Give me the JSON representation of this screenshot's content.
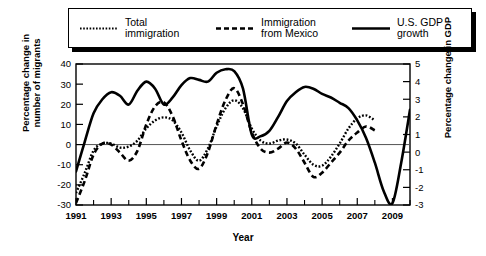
{
  "chart_data": {
    "type": "line",
    "title": "",
    "xlabel": "Year",
    "ylabel": "Percentage change in number of migrants",
    "ylabel_right": "Percentage change in GDP",
    "xlim": [
      1991,
      2010
    ],
    "ylim": [
      -30,
      40
    ],
    "ylim_right": [
      -3,
      5
    ],
    "grid": false,
    "legend_position": "top",
    "x_ticks": [
      1991,
      1993,
      1995,
      1997,
      1999,
      2001,
      2003,
      2005,
      2007,
      2009
    ],
    "x_tick_labels": [
      "1991",
      "1993",
      "1995",
      "1997",
      "1999",
      "2001",
      "2003",
      "2005",
      "2007",
      "2009"
    ],
    "x_minor_ticks": [
      1992,
      1994,
      1996,
      1998,
      2000,
      2002,
      2004,
      2006,
      2008,
      2010
    ],
    "y_ticks": [
      -30,
      -20,
      -10,
      0,
      10,
      20,
      30,
      40
    ],
    "y_tick_labels": [
      "-30",
      "-20",
      "-10",
      "0",
      "10",
      "20",
      "30",
      "40"
    ],
    "y_ticks_right": [
      -3,
      -2,
      -1,
      0,
      1,
      2,
      3,
      4,
      5
    ],
    "y_tick_labels_right": [
      "-3",
      "-2",
      "-1",
      "0",
      "1",
      "2",
      "3",
      "4",
      "5"
    ],
    "series": [
      {
        "name": "Total immigration",
        "style": "dotted",
        "axis": "left",
        "x": [
          1991,
          1991.5,
          1992,
          1992.5,
          1993,
          1993.5,
          1994,
          1994.5,
          1995,
          1995.5,
          1996,
          1996.5,
          1997,
          1997.5,
          1998,
          1998.5,
          1999,
          1999.5,
          2000,
          2000.5,
          2001,
          2001.5,
          2002,
          2002.5,
          2003,
          2003.5,
          2004,
          2004.5,
          2005,
          2005.5,
          2006,
          2006.5,
          2007,
          2007.5,
          2008
        ],
        "values": [
          -24,
          -14,
          -3,
          0.5,
          0.5,
          -1.5,
          -1,
          2,
          8,
          12,
          13.5,
          12,
          6,
          -3,
          -8,
          -2,
          9,
          18,
          22,
          18,
          8,
          2,
          0.5,
          2,
          2.5,
          0.5,
          -5,
          -10,
          -10.5,
          -6,
          0.5,
          8,
          13,
          14.5,
          12
        ]
      },
      {
        "name": "Immigration from Mexico",
        "style": "dashed",
        "axis": "left",
        "x": [
          1991,
          1991.5,
          1992,
          1992.5,
          1993,
          1993.5,
          1994,
          1994.5,
          1995,
          1995.5,
          1996,
          1996.5,
          1997,
          1997.5,
          1998,
          1998.5,
          1999,
          1999.5,
          2000,
          2000.5,
          2001,
          2001.5,
          2002,
          2002.5,
          2003,
          2003.5,
          2004,
          2004.5,
          2005,
          2005.5,
          2006,
          2006.5,
          2007,
          2007.5,
          2008
        ],
        "values": [
          -29,
          -18,
          -5,
          0.5,
          0,
          -4,
          -8,
          -3,
          10,
          19,
          21,
          14,
          2,
          -8,
          -12,
          -4,
          10,
          22,
          28,
          20,
          6,
          -2,
          -4,
          -2,
          1,
          -2,
          -9,
          -16,
          -14,
          -9,
          -4,
          2,
          6,
          9,
          7
        ]
      },
      {
        "name": "U.S. GDP growth",
        "style": "solid",
        "axis": "right",
        "x": [
          1991,
          1991.5,
          1992,
          1992.5,
          1993,
          1993.5,
          1994,
          1994.5,
          1995,
          1995.5,
          1996,
          1996.5,
          1997,
          1997.5,
          1998,
          1998.5,
          1999,
          1999.5,
          2000,
          2000.5,
          2001,
          2001.5,
          2002,
          2002.5,
          2003,
          2003.5,
          2004,
          2004.5,
          2005,
          2005.5,
          2006,
          2006.5,
          2007,
          2007.5,
          2008,
          2008.5,
          2009,
          2009.5,
          2010
        ],
        "values": [
          -1.1,
          0.6,
          2.2,
          3.0,
          3.4,
          3.2,
          2.7,
          3.5,
          4.0,
          3.6,
          2.7,
          3.1,
          3.8,
          4.2,
          4.1,
          4.0,
          4.5,
          4.7,
          4.6,
          3.6,
          1.0,
          0.9,
          1.2,
          2.0,
          2.9,
          3.4,
          3.7,
          3.6,
          3.3,
          3.1,
          2.8,
          2.5,
          1.8,
          0.8,
          -0.6,
          -2.2,
          -2.9,
          -0.6,
          2.4
        ]
      }
    ]
  },
  "legend": {
    "items": [
      {
        "label": "Total\nimmigration",
        "style": "dotted"
      },
      {
        "label": "Immigration\nfrom Mexico",
        "style": "dashed"
      },
      {
        "label": "U.S. GDP\ngrowth",
        "style": "solid"
      }
    ]
  },
  "axes": {
    "left_title": "Percentage change in\nnumber of migrants",
    "right_title": "Percentage change in GDP",
    "bottom_title": "Year"
  },
  "colors": {
    "line": "#000000",
    "frame": "#000000",
    "zero_line": "#555555",
    "background": "#ffffff"
  }
}
